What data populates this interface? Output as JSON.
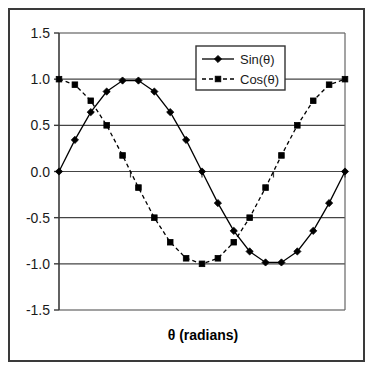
{
  "figure": {
    "background_color": "#ffffff",
    "frame_color": "#3a3a3a",
    "plot_border_color": "#555555",
    "gridline_color": "#444444"
  },
  "axes": {
    "y_tick_labels": [
      "1.5",
      "1.0",
      "0.5",
      "0.0",
      "-0.5",
      "-1.0",
      "-1.5"
    ],
    "x_axis_title": "θ (radians)",
    "y_axis_title": ""
  },
  "legend": {
    "position": "top-center-right",
    "entries": [
      {
        "label": "Sin(θ)",
        "marker": "diamond",
        "line_style": "solid",
        "color": "#000000"
      },
      {
        "label": "Cos(θ)",
        "marker": "square",
        "line_style": "dashed",
        "color": "#000000"
      }
    ]
  },
  "chart_data": {
    "type": "line",
    "title": "",
    "xlabel": "θ (radians)",
    "ylabel": "",
    "xlim": [
      0,
      6.283185307
    ],
    "ylim": [
      -1.5,
      1.5
    ],
    "yticks": [
      1.5,
      1.0,
      0.5,
      0.0,
      -0.5,
      -1.0,
      -1.5
    ],
    "ytick_labels": [
      "1.5",
      "1.0",
      "0.5",
      "0.0",
      "-0.5",
      "-1.0",
      "-1.5"
    ],
    "xticks": [
      0,
      1.5707963,
      3.1415927,
      4.712389,
      6.2831853
    ],
    "xtick_labels": [
      "",
      "",
      "",
      "",
      ""
    ],
    "grid": true,
    "grid_axis": "y",
    "legend_position": "upper center",
    "x": [
      0,
      0.349066,
      0.698132,
      1.047198,
      1.396263,
      1.745329,
      2.094395,
      2.443461,
      2.792527,
      3.141593,
      3.490659,
      3.839724,
      4.18879,
      4.537856,
      4.886922,
      5.235988,
      5.585054,
      5.934119,
      6.283185
    ],
    "series": [
      {
        "name": "Sin(θ)",
        "marker": "diamond",
        "line_style": "solid",
        "color": "#000000",
        "values": [
          0.0,
          0.342,
          0.643,
          0.866,
          0.985,
          0.985,
          0.866,
          0.643,
          0.342,
          0.0,
          -0.342,
          -0.643,
          -0.866,
          -0.985,
          -0.985,
          -0.866,
          -0.643,
          -0.342,
          0.0
        ]
      },
      {
        "name": "Cos(θ)",
        "marker": "square",
        "line_style": "dashed",
        "color": "#000000",
        "values": [
          1.0,
          0.94,
          0.766,
          0.5,
          0.174,
          -0.174,
          -0.5,
          -0.766,
          -0.94,
          -1.0,
          -0.94,
          -0.766,
          -0.5,
          -0.174,
          0.174,
          0.5,
          0.766,
          0.94,
          1.0
        ]
      }
    ]
  }
}
